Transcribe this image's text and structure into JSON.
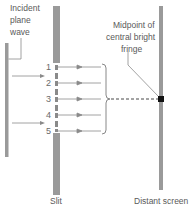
{
  "diagram": {
    "labels": {
      "incident_line1": "Incident",
      "incident_line2": "plane",
      "incident_line3": "wave",
      "midpoint_line1": "Midpoint of",
      "midpoint_line2": "central bright",
      "midpoint_line3": "fringe",
      "slit": "Slit",
      "screen": "Distant screen"
    },
    "sources": [
      "1",
      "2",
      "3",
      "4",
      "5"
    ],
    "colors": {
      "bar": "#9a9a9a",
      "line": "#8a8a8a",
      "text": "#5a5a5a",
      "marker": "#111111"
    }
  }
}
